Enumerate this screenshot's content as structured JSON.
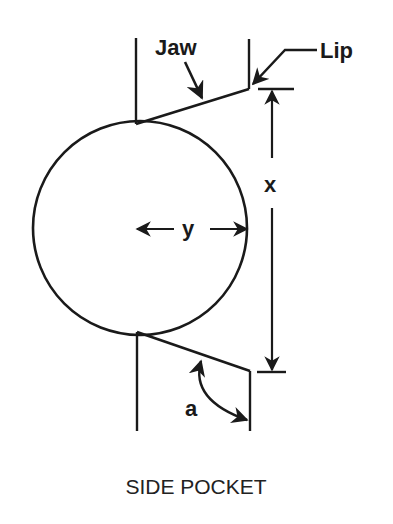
{
  "diagram": {
    "title": "SIDE POCKET",
    "colors": {
      "stroke": "#1a1a1a",
      "background": "#ffffff"
    },
    "labels": {
      "jaw": "Jaw",
      "lip": "Lip",
      "x": "x",
      "y": "y",
      "a": "a"
    },
    "annotations": {
      "x_dimension": "vertical distance between lip tips",
      "y_dimension": "ball radius",
      "a_angle": "angle between jaw and rail"
    }
  }
}
